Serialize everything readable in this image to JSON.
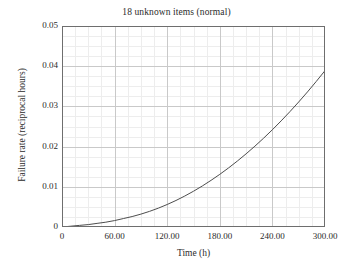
{
  "chart_data": {
    "type": "line",
    "title": "18 unknown items (normal)",
    "xlabel": "Time (h)",
    "ylabel": "Failure rate (reciprocal hours)",
    "xlim": [
      0,
      300
    ],
    "ylim": [
      0,
      0.05
    ],
    "grid": true,
    "minor_grid": true,
    "legend": null,
    "xticks": [
      0,
      60,
      120,
      180,
      240,
      300
    ],
    "xtick_labels": [
      "0",
      "60.00",
      "120.00",
      "180.00",
      "240.00",
      "300.00"
    ],
    "yticks": [
      0,
      0.01,
      0.02,
      0.03,
      0.04,
      0.05
    ],
    "ytick_labels": [
      "0",
      "0.01",
      "0.02",
      "0.03",
      "0.04",
      "0.05"
    ],
    "series": [
      {
        "name": "failure rate",
        "color": "#4d4d4d",
        "linewidth": 1.0,
        "x": [
          0,
          10,
          20,
          30,
          40,
          50,
          60,
          70,
          80,
          90,
          100,
          110,
          120,
          130,
          140,
          150,
          160,
          170,
          180,
          190,
          200,
          210,
          220,
          230,
          240,
          250,
          260,
          270,
          280,
          290,
          300
        ],
        "y": [
          0.0,
          0.0002,
          0.0004,
          0.0006,
          0.0009,
          0.0012,
          0.0016,
          0.0021,
          0.0026,
          0.0032,
          0.0039,
          0.0047,
          0.0056,
          0.0066,
          0.0077,
          0.0089,
          0.0102,
          0.0116,
          0.0131,
          0.0147,
          0.0164,
          0.0182,
          0.0201,
          0.0221,
          0.0242,
          0.0264,
          0.0287,
          0.0311,
          0.0336,
          0.0362,
          0.0389
        ]
      }
    ]
  },
  "styling": {
    "background": "#ffffff",
    "frame_color": "#6e6e6e",
    "major_grid_color": "#c9c9c9",
    "minor_grid_color": "#ededed",
    "text_color": "#2b2b2b"
  }
}
